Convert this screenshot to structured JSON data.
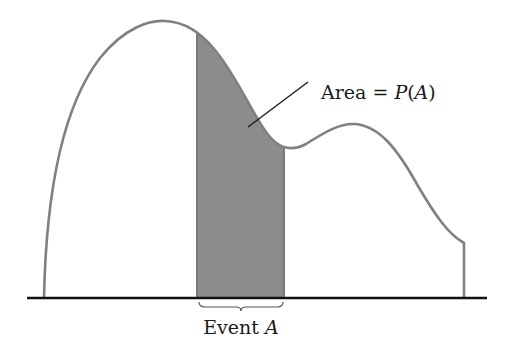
{
  "diagram": {
    "area_label": {
      "prefix": "Area = ",
      "func": "P",
      "open": "(",
      "arg": "A",
      "close": ")"
    },
    "event_label": {
      "prefix": "Event ",
      "var": "A"
    },
    "colors": {
      "curve": "#808080",
      "shade": "#8c8c8c",
      "axis": "#111111",
      "pointer": "#1a1a1a",
      "text": "#1a1a1a"
    },
    "shaded_interval_px": [
      197,
      284
    ]
  }
}
